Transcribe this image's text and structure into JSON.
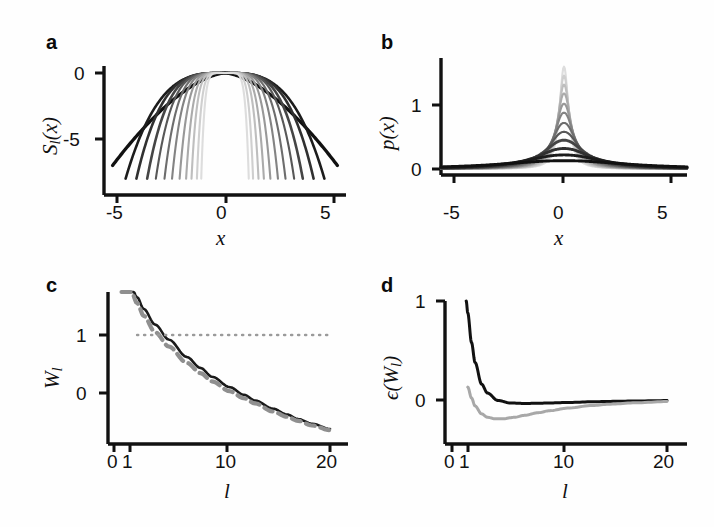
{
  "figure": {
    "panels": [
      "a",
      "b",
      "c",
      "d"
    ],
    "background": "#fefefe",
    "ink": "#111111",
    "gray": "#9a9a9a"
  },
  "panel_a": {
    "letter": "a",
    "ylabel": "S",
    "ylabel_sub": "l",
    "ylabel_tail": "(x)",
    "xlabel": "x",
    "yticks": [
      "0",
      "-5"
    ],
    "ytick_values": [
      0,
      -5
    ],
    "xticks": [
      "-5",
      "0",
      "5"
    ],
    "xtick_values": [
      -5,
      0,
      5
    ]
  },
  "panel_b": {
    "letter": "b",
    "ylabel": "p(x)",
    "xlabel": "x",
    "yticks": [
      "1",
      "0"
    ],
    "ytick_values": [
      1,
      0
    ],
    "xticks": [
      "-5",
      "0",
      "5"
    ],
    "xtick_values": [
      -5,
      0,
      5
    ]
  },
  "panel_c": {
    "letter": "c",
    "ylabel": "W",
    "ylabel_sub": "l",
    "xlabel": "l",
    "yticks": [
      "1",
      "0"
    ],
    "ytick_values": [
      1,
      0
    ],
    "xticks": [
      "0",
      "1",
      "10",
      "20"
    ],
    "xtick_values": [
      0,
      1,
      10,
      20
    ]
  },
  "panel_d": {
    "letter": "d",
    "ylabel_prefix": "ϵ(W",
    "ylabel_sub": "l",
    "ylabel_tail": ")",
    "xlabel": "l",
    "yticks": [
      "1",
      "0"
    ],
    "ytick_values": [
      1,
      0
    ],
    "xticks": [
      "0",
      "1",
      "10",
      "20"
    ],
    "xtick_values": [
      0,
      1,
      10,
      20
    ]
  },
  "chart_data": [
    {
      "id": "panel_a",
      "type": "line",
      "title": "",
      "xlabel": "x",
      "ylabel": "S_l(x)",
      "xlim": [
        -5.6,
        5.6
      ],
      "ylim": [
        -8.2,
        0.6
      ],
      "grid": false,
      "legend": "none",
      "note": "Family of log-density (entropy) curves S_l(x), each peaking at 0 at x=0 and falling off; darkest curve is broadest, lighter curves progressively narrower with steeper cutoffs.",
      "series": [
        {
          "name": "l=1",
          "shade": "#111111",
          "support": [
            -5.2,
            5.2
          ],
          "width": 5.2,
          "exponent": 1.6,
          "depth_at_edge": -7.0
        },
        {
          "name": "l=2",
          "shade": "#1c1c1c",
          "support": [
            -4.6,
            4.6
          ],
          "width": 4.6,
          "exponent": 3.2,
          "depth_at_edge": -8.0
        },
        {
          "name": "l=3",
          "shade": "#303030",
          "support": [
            -4.1,
            4.1
          ],
          "width": 4.1,
          "exponent": 3.6,
          "depth_at_edge": -8.0
        },
        {
          "name": "l=4",
          "shade": "#454545",
          "support": [
            -3.6,
            3.6
          ],
          "width": 3.6,
          "exponent": 4.0,
          "depth_at_edge": -8.0
        },
        {
          "name": "l=5",
          "shade": "#585858",
          "support": [
            -3.2,
            3.2
          ],
          "width": 3.2,
          "exponent": 4.4,
          "depth_at_edge": -8.0
        },
        {
          "name": "l=6",
          "shade": "#6d6d6d",
          "support": [
            -2.8,
            2.8
          ],
          "width": 2.8,
          "exponent": 4.8,
          "depth_at_edge": -8.0
        },
        {
          "name": "l=7",
          "shade": "#838383",
          "support": [
            -2.45,
            2.45
          ],
          "width": 2.45,
          "exponent": 5.2,
          "depth_at_edge": -8.0
        },
        {
          "name": "l=8",
          "shade": "#989898",
          "support": [
            -2.1,
            2.1
          ],
          "width": 2.1,
          "exponent": 5.6,
          "depth_at_edge": -8.0
        },
        {
          "name": "l=9",
          "shade": "#ababab",
          "support": [
            -1.8,
            1.8
          ],
          "width": 1.8,
          "exponent": 6.0,
          "depth_at_edge": -8.0
        },
        {
          "name": "l=10",
          "shade": "#bebebe",
          "support": [
            -1.55,
            1.55
          ],
          "width": 1.55,
          "exponent": 6.4,
          "depth_at_edge": -8.0
        },
        {
          "name": "l=11",
          "shade": "#cfcfcf",
          "support": [
            -1.3,
            1.3
          ],
          "width": 1.3,
          "exponent": 6.8,
          "depth_at_edge": -8.0
        },
        {
          "name": "l=12",
          "shade": "#dddddd",
          "support": [
            -1.1,
            1.1
          ],
          "width": 1.1,
          "exponent": 7.2,
          "depth_at_edge": -8.0
        }
      ]
    },
    {
      "id": "panel_b",
      "type": "line",
      "title": "",
      "xlabel": "x",
      "ylabel": "p(x)",
      "xlim": [
        -5.6,
        5.6
      ],
      "ylim": [
        0,
        1.75
      ],
      "grid": false,
      "legend": "none",
      "note": "Corresponding probability densities p(x)=exp(S_l(x)); darkest is broad and nearly flat with peak about 0.13, successively lighter curves are taller and narrower, tallest light curve peaks near 1.6.",
      "series": [
        {
          "name": "l=1",
          "shade": "#111111",
          "peak": 0.13,
          "halfwidth": 3.4
        },
        {
          "name": "l=2",
          "shade": "#1c1c1c",
          "peak": 0.22,
          "halfwidth": 2.1
        },
        {
          "name": "l=3",
          "shade": "#303030",
          "peak": 0.32,
          "halfwidth": 1.5
        },
        {
          "name": "l=4",
          "shade": "#454545",
          "peak": 0.45,
          "halfwidth": 1.1
        },
        {
          "name": "l=5",
          "shade": "#585858",
          "peak": 0.58,
          "halfwidth": 0.85
        },
        {
          "name": "l=6",
          "shade": "#6d6d6d",
          "peak": 0.72,
          "halfwidth": 0.68
        },
        {
          "name": "l=7",
          "shade": "#838383",
          "peak": 0.88,
          "halfwidth": 0.55
        },
        {
          "name": "l=8",
          "shade": "#989898",
          "peak": 1.02,
          "halfwidth": 0.46
        },
        {
          "name": "l=9",
          "shade": "#ababab",
          "peak": 1.18,
          "halfwidth": 0.39
        },
        {
          "name": "l=10",
          "shade": "#bebebe",
          "peak": 1.32,
          "halfwidth": 0.33
        },
        {
          "name": "l=11",
          "shade": "#cfcfcf",
          "peak": 1.46,
          "halfwidth": 0.28
        },
        {
          "name": "l=12",
          "shade": "#dddddd",
          "peak": 1.6,
          "halfwidth": 0.24
        }
      ]
    },
    {
      "id": "panel_c",
      "type": "line",
      "title": "",
      "xlabel": "l",
      "ylabel": "W_l",
      "xlim": [
        0.55,
        20
      ],
      "ylim": [
        -1.1,
        2.1
      ],
      "xscale": "log",
      "grid": false,
      "legend": "none",
      "note": "W_l decreases monotonically from above 2 near l=0.7 through 1 near l=1.2 and 0 near l=3, to about -0.62 at l=20. Gray dashed approximation lies just below the black solid exact curve. Gray dotted reference line at W=1.",
      "series": [
        {
          "name": "W_l exact",
          "style": "solid",
          "color": "#1a1a1a",
          "x": [
            0.7,
            0.8,
            0.9,
            1.0,
            1.2,
            1.5,
            2.0,
            2.5,
            3.0,
            4.0,
            5.0,
            6.0,
            8.0,
            10.0,
            12.0,
            15.0,
            20.0
          ],
          "y": [
            2.1,
            1.9,
            1.65,
            1.45,
            1.18,
            0.92,
            0.62,
            0.43,
            0.28,
            0.1,
            -0.03,
            -0.13,
            -0.27,
            -0.37,
            -0.45,
            -0.53,
            -0.62
          ]
        },
        {
          "name": "W_l approx",
          "style": "dashed",
          "color": "#8f8f8f",
          "x": [
            0.7,
            0.8,
            0.9,
            1.0,
            1.2,
            1.5,
            2.0,
            2.5,
            3.0,
            4.0,
            5.0,
            6.0,
            8.0,
            10.0,
            12.0,
            15.0,
            20.0
          ],
          "y": [
            2.1,
            1.82,
            1.55,
            1.33,
            1.05,
            0.8,
            0.52,
            0.34,
            0.2,
            0.03,
            -0.09,
            -0.18,
            -0.32,
            -0.41,
            -0.48,
            -0.56,
            -0.64
          ]
        },
        {
          "name": "reference",
          "style": "dotted",
          "color": "#9a9a9a",
          "constant_y": 1.0,
          "x_range": [
            0.9,
            20
          ]
        }
      ]
    },
    {
      "id": "panel_d",
      "type": "line",
      "title": "",
      "xlabel": "l",
      "ylabel": "ϵ(W_l)",
      "xlim": [
        0.55,
        20
      ],
      "ylim": [
        -0.42,
        1.05
      ],
      "xscale": "log",
      "grid": false,
      "legend": "none",
      "note": "Relative error curves. Black curve falls steeply from 1 at small l to a shallow minimum near -0.03 around l=2 then approaches 0. Gray curve starts near 0.13, dips to about -0.19 near l=1.4, then rises slowly toward 0.",
      "series": [
        {
          "name": "ϵ black",
          "style": "solid",
          "color": "#111111",
          "x": [
            0.78,
            0.8,
            0.85,
            0.9,
            1.0,
            1.1,
            1.3,
            1.6,
            2.0,
            2.5,
            3.0,
            4.0,
            6.0,
            8.0,
            12.0,
            20.0
          ],
          "y": [
            1.0,
            0.88,
            0.58,
            0.38,
            0.16,
            0.07,
            -0.005,
            -0.03,
            -0.035,
            -0.033,
            -0.03,
            -0.025,
            -0.018,
            -0.014,
            -0.01,
            -0.006
          ]
        },
        {
          "name": "ϵ gray",
          "style": "solid",
          "color": "#a8a8a8",
          "x": [
            0.8,
            0.85,
            0.9,
            1.0,
            1.1,
            1.25,
            1.4,
            1.7,
            2.0,
            2.5,
            3.0,
            4.0,
            6.0,
            8.0,
            12.0,
            20.0
          ],
          "y": [
            0.13,
            0.02,
            -0.06,
            -0.14,
            -0.175,
            -0.19,
            -0.19,
            -0.175,
            -0.155,
            -0.128,
            -0.108,
            -0.082,
            -0.055,
            -0.042,
            -0.028,
            -0.016
          ]
        }
      ]
    }
  ]
}
